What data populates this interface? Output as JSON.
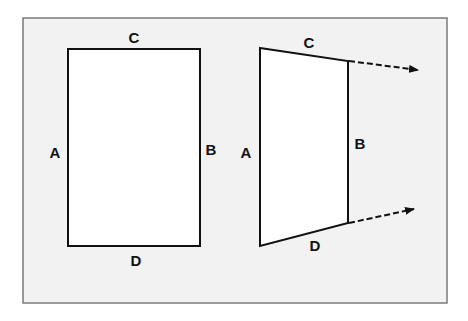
{
  "colors": {
    "background": "#ffffff",
    "panel": "#f2f2f2",
    "panel_border": "#7a7a7a",
    "shape_fill": "#ffffff",
    "stroke": "#111111"
  },
  "left_figure": {
    "shape": "rectangle",
    "labels": {
      "top": "C",
      "right": "B",
      "bottom": "D",
      "left": "A"
    }
  },
  "right_figure": {
    "shape": "trapezoid",
    "labels": {
      "top": "C",
      "right": "B",
      "bottom": "D",
      "left": "A"
    },
    "arrows": [
      {
        "from": "top-right corner",
        "style": "dashed"
      },
      {
        "from": "bottom-right corner",
        "style": "dashed"
      }
    ]
  }
}
